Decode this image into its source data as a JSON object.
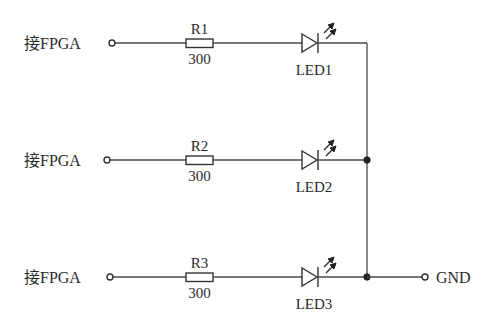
{
  "diagram": {
    "type": "circuit-schematic",
    "colors": {
      "line": "#4a4a4a",
      "text": "#2a2a2a",
      "background": "#ffffff"
    },
    "branches": [
      {
        "input_label": "接FPGA",
        "resistor_name": "R1",
        "resistor_value": "300",
        "led_name": "LED1",
        "y": 43
      },
      {
        "input_label": "接FPGA",
        "resistor_name": "R2",
        "resistor_value": "300",
        "led_name": "LED2",
        "y": 160
      },
      {
        "input_label": "接FPGA",
        "resistor_name": "R3",
        "resistor_value": "300",
        "led_name": "LED3",
        "y": 277
      }
    ],
    "ground": {
      "label": "GND"
    },
    "junctions": [
      "LED2-bus",
      "LED3-bus"
    ]
  }
}
